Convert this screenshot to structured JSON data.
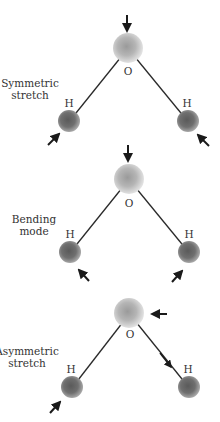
{
  "diagram": {
    "colors": {
      "background": "#ffffff",
      "bond": "#2a2a2a",
      "arrow": "#1a1a1a",
      "oxygen": "#b3b3b3",
      "hydrogen": "#6e6e6e",
      "text": "#333333"
    },
    "panels": [
      {
        "mode_label_line1": "Symmetric",
        "mode_label_line2": "stretch",
        "oxygen_label": "O",
        "left_h_label": "H",
        "right_h_label": "H",
        "arrows": [
          "O: down",
          "left H: up-right (inward)",
          "right H: up-left (inward)"
        ]
      },
      {
        "mode_label_line1": "Bending",
        "mode_label_line2": "mode",
        "oxygen_label": "O",
        "left_h_label": "H",
        "right_h_label": "H",
        "arrows": [
          "O: down",
          "left H: up-left",
          "right H: up-right"
        ]
      },
      {
        "mode_label_line1": "Asymmetric",
        "mode_label_line2": "stretch",
        "oxygen_label": "O",
        "left_h_label": "H",
        "right_h_label": "H",
        "arrows": [
          "O: left",
          "right bond: down-right toward H",
          "left H: up-right"
        ]
      }
    ]
  }
}
